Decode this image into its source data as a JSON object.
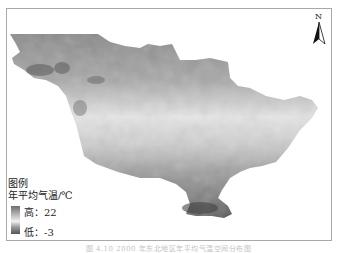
{
  "map": {
    "legend": {
      "title": "图例",
      "subtitle": "年平均气温/℃",
      "high_label": "高：22",
      "low_label": "低：-3",
      "high_value": 22,
      "low_value": -3,
      "unit": "℃"
    },
    "north_arrow": {
      "label": "N",
      "icon": "north-arrow-icon"
    },
    "caption": "图 4.10 2000 年东北地区年平均气温空间分布图",
    "colors": {
      "low": "#555555",
      "mid": "#f0f0f0",
      "high": "#6e6e6e",
      "frame": "#a8a8a8"
    }
  }
}
